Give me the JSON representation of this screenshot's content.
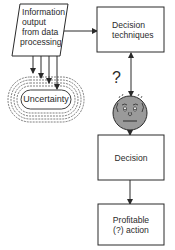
{
  "diagram": {
    "nodes": {
      "information_output": {
        "shape": "parallelogram",
        "lines": [
          "Information",
          "output",
          "from data",
          "processing"
        ]
      },
      "decision_techniques": {
        "shape": "rectangle",
        "lines": [
          "Decision",
          "techniques"
        ]
      },
      "uncertainty": {
        "shape": "concentric-rounded-rings",
        "label": "Uncertainty"
      },
      "decision_maker": {
        "shape": "face",
        "symbol": "?"
      },
      "decision": {
        "shape": "rectangle",
        "label": "Decision"
      },
      "profitable_action": {
        "shape": "rectangle",
        "lines": [
          "Profitable",
          "(?) action"
        ]
      }
    },
    "edges": [
      {
        "from": "information_output",
        "to": "decision_techniques",
        "type": "arrow"
      },
      {
        "from": "information_output",
        "to": "uncertainty",
        "type": "arrow",
        "count": 4
      },
      {
        "from": "decision_techniques",
        "to": "decision_maker",
        "type": "double-arrow"
      },
      {
        "from": "decision_maker",
        "to": "decision",
        "type": "arrow"
      },
      {
        "from": "decision",
        "to": "profitable_action",
        "type": "arrow"
      }
    ],
    "colors": {
      "line": "#2a2a2a",
      "face_fill": "#9a9a9a",
      "background": "#ffffff"
    }
  }
}
